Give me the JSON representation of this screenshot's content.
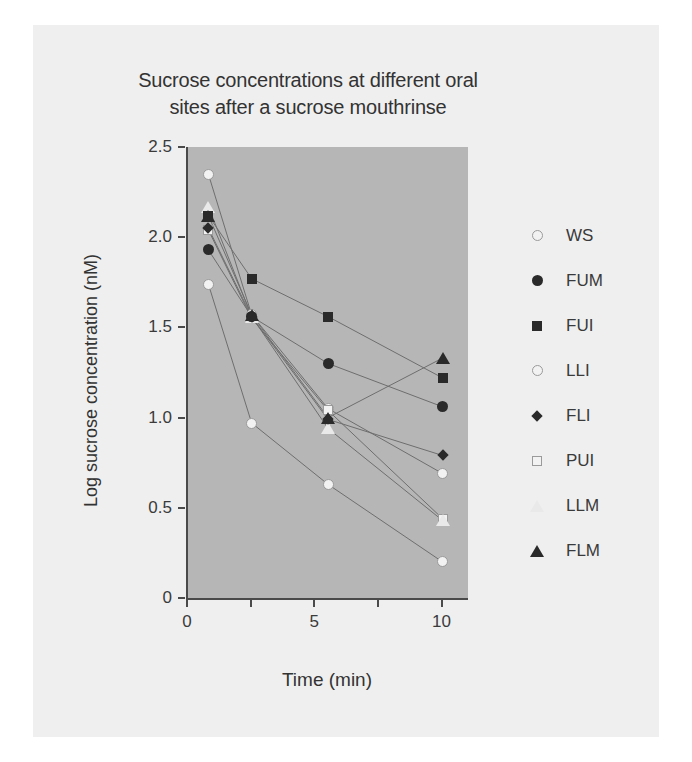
{
  "chart_data": {
    "type": "line",
    "title": "Sucrose concentrations at different oral sites after a sucrose mouthrinse",
    "title_line1": "Sucrose concentrations at different oral",
    "title_line2": "sites after a sucrose mouthrinse",
    "xlabel": "Time (min)",
    "ylabel": "Log sucrose concentration (nM)",
    "xlim": [
      0,
      11
    ],
    "ylim": [
      0,
      2.5
    ],
    "xticks": [
      0,
      2.5,
      5,
      7.5,
      10
    ],
    "xtick_labels": [
      "0",
      "",
      "5",
      "",
      "10"
    ],
    "yticks": [
      0,
      0.5,
      1.0,
      1.5,
      2.0,
      2.5
    ],
    "ytick_labels": [
      "0",
      "0.5",
      "1.0",
      "1.5",
      "2.0",
      "2.5"
    ],
    "grid": false,
    "legend_position": "right",
    "plot_background": "#b6b6b6",
    "figure_background": "#efefef",
    "x": [
      0.8,
      2.5,
      5.5,
      10
    ],
    "series": [
      {
        "name": "WS",
        "marker": "circle-open",
        "color": "#f2f2f2",
        "values": [
          2.35,
          1.57,
          1.05,
          0.69
        ]
      },
      {
        "name": "FUM",
        "marker": "circle-filled",
        "color": "#2a2a2a",
        "values": [
          1.93,
          1.56,
          1.3,
          1.06
        ]
      },
      {
        "name": "FUI",
        "marker": "square-filled",
        "color": "#2a2a2a",
        "values": [
          2.12,
          1.77,
          1.56,
          1.22
        ]
      },
      {
        "name": "LLI",
        "marker": "circle-open",
        "color": "#f2f2f2",
        "values": [
          1.74,
          0.97,
          0.63,
          0.2
        ]
      },
      {
        "name": "FLI",
        "marker": "diamond-filled",
        "color": "#2a2a2a",
        "values": [
          2.05,
          1.56,
          0.99,
          0.79
        ]
      },
      {
        "name": "PUI",
        "marker": "square-open",
        "color": "#f2f2f2",
        "values": [
          2.04,
          1.55,
          1.04,
          0.44
        ]
      },
      {
        "name": "LLM",
        "marker": "triangle-open",
        "color": "#e9e9e9",
        "values": [
          2.17,
          1.56,
          0.94,
          0.43
        ]
      },
      {
        "name": "FLM",
        "marker": "triangle-filled",
        "color": "#2a2a2a",
        "values": [
          2.12,
          1.57,
          1.0,
          1.33
        ]
      }
    ]
  },
  "legend": {
    "items": [
      {
        "label": "WS",
        "marker": "circle-open"
      },
      {
        "label": "FUM",
        "marker": "circle-filled"
      },
      {
        "label": "FUI",
        "marker": "square-filled"
      },
      {
        "label": "LLI",
        "marker": "circle-open"
      },
      {
        "label": "FLI",
        "marker": "diamond-filled"
      },
      {
        "label": "PUI",
        "marker": "square-open"
      },
      {
        "label": "LLM",
        "marker": "triangle-open"
      },
      {
        "label": "FLM",
        "marker": "triangle-filled"
      }
    ]
  }
}
